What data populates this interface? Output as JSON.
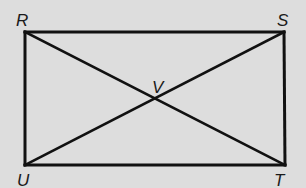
{
  "diagram": {
    "type": "rectangle-with-diagonals",
    "stroke_color": "#111111",
    "background": "#dddddd",
    "vertices": {
      "R": {
        "label": "R",
        "x": 25,
        "y": 32
      },
      "S": {
        "label": "S",
        "x": 284,
        "y": 32
      },
      "T": {
        "label": "T",
        "x": 285,
        "y": 165
      },
      "U": {
        "label": "U",
        "x": 25,
        "y": 165
      }
    },
    "intersection": {
      "label": "V",
      "x": 155,
      "y": 99
    },
    "segments": [
      "RS",
      "ST",
      "TU",
      "UR",
      "RT",
      "SU"
    ]
  }
}
